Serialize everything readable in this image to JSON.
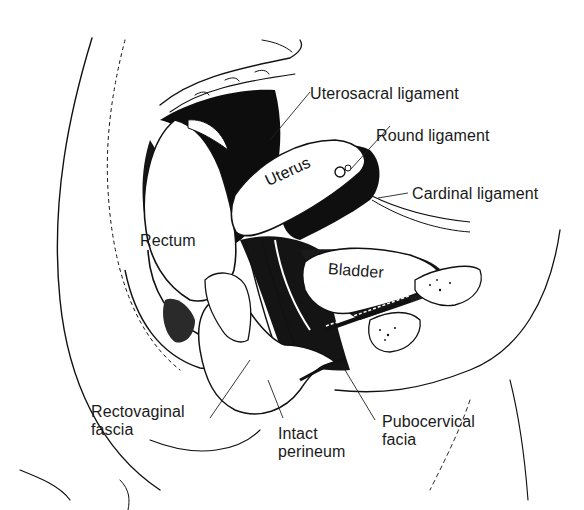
{
  "figure": {
    "type": "anatomical-illustration",
    "background": "#ffffff",
    "ink": "#111111"
  },
  "labels": {
    "uterosacral_ligament": "Uterosacral ligament",
    "round_ligament": "Round ligament",
    "cardinal_ligament": "Cardinal ligament",
    "uterus": "Uterus",
    "rectum": "Rectum",
    "bladder": "Bladder",
    "rectovaginal_fascia": {
      "line1": "Rectovaginal",
      "line2": "fascia"
    },
    "intact_perineum": {
      "line1": "Intact",
      "line2": "perineum"
    },
    "pubocervical_facia": {
      "line1": "Pubocervical",
      "line2": "facia"
    }
  }
}
